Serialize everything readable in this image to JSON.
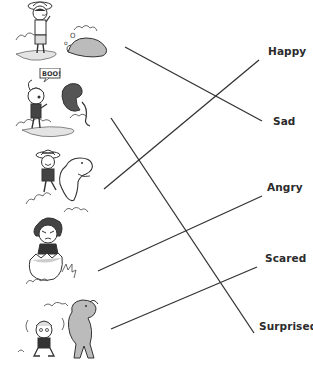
{
  "worksheet": {
    "type": "match-the-emotion",
    "pictures": [
      {
        "id": "pic-1",
        "description": "boy with hat crying, sleeping dinosaur",
        "icon": "crying-child-icon"
      },
      {
        "id": "pic-2",
        "description": "girl with pigtails surprised by dinosaur saying BOO!",
        "icon": "surprised-child-icon",
        "speech_bubble": "BOO!"
      },
      {
        "id": "pic-3",
        "description": "boy with striped hat riding a smiling dinosaur",
        "icon": "happy-child-icon"
      },
      {
        "id": "pic-4",
        "description": "frowning child standing in broken egg",
        "icon": "angry-child-icon"
      },
      {
        "id": "pic-5",
        "description": "trembling child in front of big dinosaur",
        "icon": "scared-child-icon"
      }
    ],
    "labels": [
      {
        "text": "Happy",
        "x": 268,
        "y": 55
      },
      {
        "text": "Sad",
        "x": 273,
        "y": 125
      },
      {
        "text": "Angry",
        "x": 267,
        "y": 191
      },
      {
        "text": "Scared",
        "x": 265,
        "y": 262
      },
      {
        "text": "Surprised",
        "x": 259,
        "y": 330
      }
    ],
    "connections": [
      {
        "from": "pic-1",
        "to": "Sad",
        "x1": 125,
        "y1": 47,
        "x2": 262,
        "y2": 121
      },
      {
        "from": "pic-2",
        "to": "Surprised",
        "x1": 111,
        "y1": 118,
        "x2": 254,
        "y2": 333
      },
      {
        "from": "pic-3",
        "to": "Happy",
        "x1": 104,
        "y1": 189,
        "x2": 259,
        "y2": 60
      },
      {
        "from": "pic-4",
        "to": "Angry",
        "x1": 98,
        "y1": 271,
        "x2": 262,
        "y2": 196
      },
      {
        "from": "pic-5",
        "to": "Scared",
        "x1": 111,
        "y1": 329,
        "x2": 257,
        "y2": 267
      }
    ],
    "line_color": "#333333"
  }
}
